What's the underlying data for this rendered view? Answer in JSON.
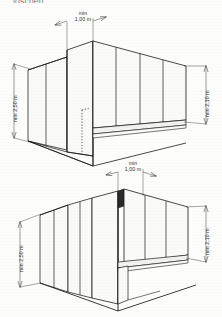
{
  "document": {
    "cutoff_caption": "loschen",
    "figure_count": 2
  },
  "figures": [
    {
      "id": "upper-figure",
      "name": "axonometric-room-view-upper",
      "dimensions": [
        {
          "id": "upper-width",
          "name": "min-width-dimension",
          "orientation": "horizontal",
          "prefix": "min",
          "value": "1,00 m",
          "position": "top"
        },
        {
          "id": "upper-left-height",
          "name": "min-height-left-dimension",
          "orientation": "vertical",
          "prefix": "min",
          "value": "2,50 m",
          "position": "left"
        },
        {
          "id": "upper-right-height",
          "name": "min-height-right-dimension",
          "orientation": "vertical",
          "prefix": "min",
          "value": "2,10 m",
          "position": "right"
        }
      ]
    },
    {
      "id": "lower-figure",
      "name": "axonometric-room-view-lower",
      "dimensions": [
        {
          "id": "lower-width",
          "name": "min-width-dimension",
          "orientation": "horizontal",
          "prefix": "min",
          "value": "1,00 m",
          "position": "top"
        },
        {
          "id": "lower-left-height",
          "name": "min-height-left-dimension",
          "orientation": "vertical",
          "prefix": "min",
          "value": "2,50 m",
          "position": "left"
        },
        {
          "id": "lower-right-height",
          "name": "min-height-right-dimension",
          "orientation": "vertical",
          "prefix": "min",
          "value": "2,10 m",
          "position": "right"
        }
      ]
    }
  ],
  "style": {
    "line_color": "#1b1b1b",
    "fill_color": "#fafaf8",
    "fill_color_shade": "#f2f2f0",
    "background": "#fdfdfc",
    "dimension_line_color": "#3a3a3a"
  }
}
